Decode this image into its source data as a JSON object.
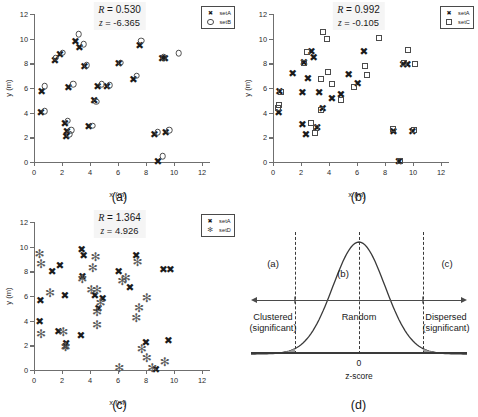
{
  "figure": {
    "axes": {
      "xlabel": "x (m)",
      "ylabel": "y (m)",
      "xticks": [
        "0",
        "2",
        "4",
        "6",
        "8",
        "10",
        "12"
      ],
      "yticks": [
        "0",
        "2",
        "4",
        "6",
        "8",
        "10",
        "12"
      ],
      "xlim": [
        0,
        12
      ],
      "ylim": [
        0,
        12
      ]
    },
    "captions": {
      "a": "(a)",
      "b": "(b)",
      "c": "(c)",
      "d": "(d)"
    }
  },
  "chart_data": [
    {
      "type": "scatter",
      "panel": "(a)",
      "title": "",
      "xlabel": "x (m)",
      "ylabel": "y (m)",
      "xlim": [
        0,
        12
      ],
      "ylim": [
        0,
        12
      ],
      "grid": false,
      "legend_position": "top-right",
      "annotations": {
        "R_label": "R",
        "R_value": "0.530",
        "z_label": "z",
        "z_value": "-6.365"
      },
      "series": [
        {
          "name": "setA",
          "marker": "x",
          "points": [
            [
              0.55,
              5.75
            ],
            [
              0.5,
              4.05
            ],
            [
              1.5,
              8.3
            ],
            [
              1.85,
              8.75
            ],
            [
              2.2,
              3.2
            ],
            [
              2.3,
              2.1
            ],
            [
              2.35,
              2.5
            ],
            [
              2.95,
              9.85
            ],
            [
              3.25,
              9.35
            ],
            [
              3.6,
              7.75
            ],
            [
              2.45,
              6.1
            ],
            [
              3.9,
              2.95
            ],
            [
              4.3,
              5.0
            ],
            [
              4.55,
              6.15
            ],
            [
              5.2,
              6.2
            ],
            [
              6.05,
              8.05
            ],
            [
              7.1,
              6.75
            ],
            [
              7.55,
              9.5
            ],
            [
              8.6,
              2.25
            ],
            [
              9.35,
              8.4
            ],
            [
              9.4,
              2.45
            ],
            [
              8.85,
              0.05
            ],
            [
              9.15,
              8.45
            ]
          ]
        },
        {
          "name": "setB",
          "marker": "o",
          "points": [
            [
              0.75,
              6.15
            ],
            [
              0.75,
              4.1
            ],
            [
              1.55,
              8.45
            ],
            [
              2.05,
              8.85
            ],
            [
              2.4,
              3.35
            ],
            [
              2.5,
              2.25
            ],
            [
              2.65,
              2.6
            ],
            [
              3.2,
              10.35
            ],
            [
              3.55,
              9.55
            ],
            [
              3.75,
              7.85
            ],
            [
              2.8,
              6.3
            ],
            [
              4.2,
              2.95
            ],
            [
              4.45,
              4.9
            ],
            [
              4.85,
              6.3
            ],
            [
              5.4,
              6.25
            ],
            [
              6.2,
              8.05
            ],
            [
              7.35,
              7.0
            ],
            [
              7.65,
              9.85
            ],
            [
              8.85,
              2.4
            ],
            [
              9.25,
              8.5
            ],
            [
              9.65,
              2.6
            ],
            [
              9.2,
              0.45
            ],
            [
              10.35,
              8.8
            ]
          ]
        }
      ]
    },
    {
      "type": "scatter",
      "panel": "(b)",
      "title": "",
      "xlabel": "x (m)",
      "ylabel": "y (m)",
      "xlim": [
        0,
        12
      ],
      "ylim": [
        0,
        12
      ],
      "grid": false,
      "legend_position": "top-right",
      "annotations": {
        "R_label": "R",
        "R_value": "0.992",
        "z_label": "z",
        "z_value": "-0.105"
      },
      "series": [
        {
          "name": "setA",
          "marker": "x",
          "points": [
            [
              0.45,
              5.75
            ],
            [
              0.4,
              4.05
            ],
            [
              1.4,
              7.25
            ],
            [
              2.2,
              8.1
            ],
            [
              2.75,
              9.0
            ],
            [
              2.9,
              8.5
            ],
            [
              2.5,
              6.85
            ],
            [
              2.1,
              5.7
            ],
            [
              2.1,
              3.1
            ],
            [
              2.35,
              2.3
            ],
            [
              3.15,
              2.85
            ],
            [
              3.3,
              5.65
            ],
            [
              3.55,
              4.35
            ],
            [
              4.2,
              5.15
            ],
            [
              4.85,
              5.55
            ],
            [
              5.4,
              7.1
            ],
            [
              6.05,
              6.4
            ],
            [
              6.5,
              9.0
            ],
            [
              8.6,
              2.5
            ],
            [
              9.0,
              0.1
            ],
            [
              9.3,
              7.95
            ],
            [
              9.6,
              7.95
            ],
            [
              9.95,
              2.55
            ]
          ]
        },
        {
          "name": "setC",
          "marker": "s",
          "points": [
            [
              0.6,
              5.7
            ],
            [
              0.4,
              4.65
            ],
            [
              0.35,
              4.35
            ],
            [
              2.2,
              8.05
            ],
            [
              2.45,
              8.95
            ],
            [
              3.6,
              10.55
            ],
            [
              3.85,
              10.0
            ],
            [
              3.4,
              6.75
            ],
            [
              2.7,
              3.15
            ],
            [
              3.1,
              2.75
            ],
            [
              3.0,
              2.35
            ],
            [
              3.4,
              4.25
            ],
            [
              3.9,
              7.3
            ],
            [
              4.2,
              6.3
            ],
            [
              4.85,
              5.05
            ],
            [
              5.75,
              6.1
            ],
            [
              6.6,
              7.8
            ],
            [
              6.7,
              7.05
            ],
            [
              7.6,
              10.05
            ],
            [
              8.55,
              2.7
            ],
            [
              9.05,
              0.1
            ],
            [
              9.35,
              8.0
            ],
            [
              9.65,
              9.05
            ],
            [
              10.15,
              7.95
            ],
            [
              10.1,
              2.6
            ]
          ]
        }
      ]
    },
    {
      "type": "scatter",
      "panel": "(c)",
      "title": "",
      "xlabel": "x (m)",
      "ylabel": "y (m)",
      "xlim": [
        0,
        12
      ],
      "ylim": [
        0,
        12
      ],
      "grid": false,
      "legend_position": "top-right",
      "annotations": {
        "R_label": "R",
        "R_value": "1.364",
        "z_label": "z",
        "z_value": "4.926"
      },
      "series": [
        {
          "name": "setA",
          "marker": "x",
          "points": [
            [
              0.45,
              5.7
            ],
            [
              0.4,
              4.0
            ],
            [
              1.3,
              8.0
            ],
            [
              1.85,
              8.55
            ],
            [
              1.75,
              3.2
            ],
            [
              2.25,
              1.95
            ],
            [
              2.3,
              2.2
            ],
            [
              3.4,
              9.85
            ],
            [
              3.55,
              9.3
            ],
            [
              3.45,
              7.6
            ],
            [
              2.2,
              6.05
            ],
            [
              3.35,
              2.85
            ],
            [
              4.35,
              6.1
            ],
            [
              4.6,
              5.0
            ],
            [
              4.9,
              5.85
            ],
            [
              6.05,
              8.0
            ],
            [
              6.85,
              6.7
            ],
            [
              7.3,
              9.35
            ],
            [
              8.0,
              2.25
            ],
            [
              9.25,
              8.2
            ],
            [
              9.6,
              2.45
            ],
            [
              8.7,
              0.1
            ],
            [
              9.75,
              8.2
            ]
          ]
        },
        {
          "name": "setD",
          "marker": "*",
          "points": [
            [
              0.4,
              9.4
            ],
            [
              0.5,
              8.6
            ],
            [
              0.5,
              2.9
            ],
            [
              1.15,
              6.25
            ],
            [
              2.1,
              3.1
            ],
            [
              2.25,
              1.9
            ],
            [
              3.45,
              7.4
            ],
            [
              4.1,
              6.5
            ],
            [
              4.2,
              8.25
            ],
            [
              4.4,
              9.2
            ],
            [
              4.5,
              6.45
            ],
            [
              4.5,
              4.7
            ],
            [
              4.5,
              3.65
            ],
            [
              4.75,
              5.4
            ],
            [
              6.3,
              7.2
            ],
            [
              6.55,
              7.5
            ],
            [
              7.4,
              8.75
            ],
            [
              7.5,
              5.05
            ],
            [
              7.3,
              4.25
            ],
            [
              7.7,
              1.7
            ],
            [
              8.05,
              5.8
            ],
            [
              8.05,
              0.95
            ],
            [
              8.45,
              0.15
            ],
            [
              9.35,
              0.65
            ],
            [
              6.1,
              0.2
            ]
          ]
        }
      ]
    },
    {
      "type": "line",
      "panel": "(d)",
      "title": "",
      "xlabel": "z-score",
      "ylabel": "",
      "grid": false,
      "curve": "normal distribution",
      "center_tick_label": "0",
      "region_markers": [
        "(a)",
        "(b)",
        "(c)"
      ],
      "regions": [
        {
          "marker": "(a)",
          "label_line1": "Clustered",
          "label_line2": "(significant)"
        },
        {
          "marker": "(b)",
          "label_line1": "Random",
          "label_line2": ""
        },
        {
          "marker": "(c)",
          "label_line1": "Dispersed",
          "label_line2": "(significant)"
        }
      ]
    }
  ],
  "panels": {
    "a": {
      "caption": "(a)",
      "stats": {
        "r_symbol": "R",
        "r_eq": "= 0.530",
        "z_symbol": "z",
        "z_eq": "= -6.365"
      },
      "legend": [
        {
          "key": "x",
          "label": "setA"
        },
        {
          "key": "o",
          "label": "setB"
        }
      ]
    },
    "b": {
      "caption": "(b)",
      "stats": {
        "r_symbol": "R",
        "r_eq": "= 0.992",
        "z_symbol": "z",
        "z_eq": "= -0.105"
      },
      "legend": [
        {
          "key": "x",
          "label": "setA"
        },
        {
          "key": "s",
          "label": "setC"
        }
      ]
    },
    "c": {
      "caption": "(c)",
      "stats": {
        "r_symbol": "R",
        "r_eq": "= 1.364",
        "z_symbol": "z",
        "z_eq": "= 4.926"
      },
      "legend": [
        {
          "key": "x",
          "label": "setA"
        },
        {
          "key": "*",
          "label": "setD"
        }
      ]
    },
    "d": {
      "caption": "(d)",
      "marker_a": "(a)",
      "marker_b": "(b)",
      "marker_c": "(c)",
      "left_label_1": "Clustered",
      "left_label_2": "(significant)",
      "center_label": "Random",
      "right_label_1": "Dispersed",
      "right_label_2": "(significant)",
      "zero_label": "0",
      "axis_label": "z-score"
    }
  },
  "colors": {
    "marker_dark": "#1b1b1b",
    "marker_gray": "#5a5a5a",
    "axis": "#6f6f6f",
    "background": "#ffffff"
  }
}
